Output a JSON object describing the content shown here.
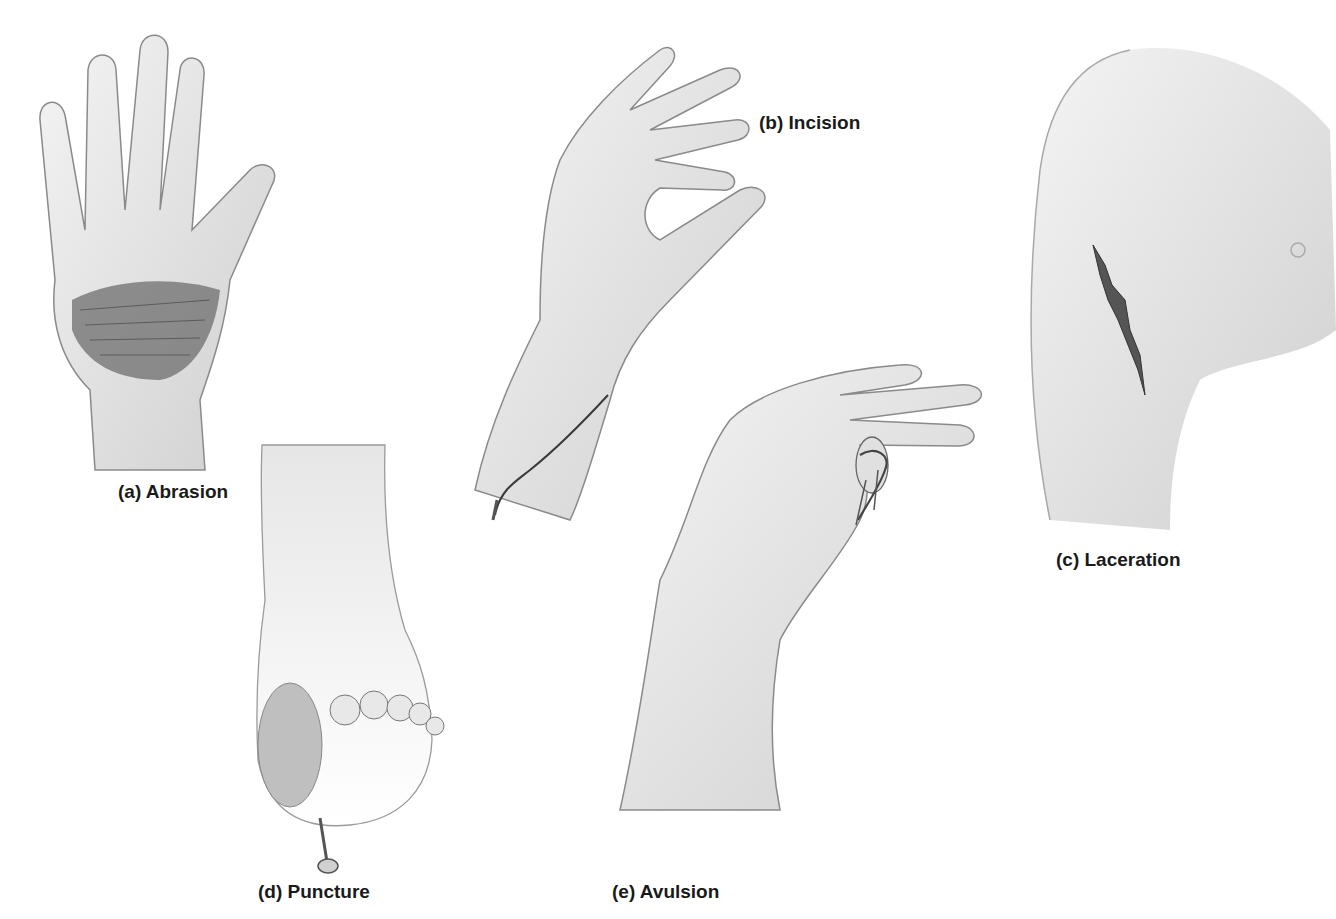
{
  "figure": {
    "panels": [
      {
        "id": "a",
        "label": "(a) Abrasion",
        "subject": "palm of hand with scraped skin"
      },
      {
        "id": "b",
        "label": "(b) Incision",
        "subject": "hand and wrist with straight cut"
      },
      {
        "id": "c",
        "label": "(c) Laceration",
        "subject": "upper arm with jagged tear"
      },
      {
        "id": "d",
        "label": "(d) Puncture",
        "subject": "sole of foot pierced by nail"
      },
      {
        "id": "e",
        "label": "(e) Avulsion",
        "subject": "hand with torn flap of skin on thumb"
      }
    ],
    "colors": {
      "skin": "#efefef",
      "shade": "#c8c8c8",
      "outline": "#8a8a8a",
      "wound": "#555555",
      "text": "#1a1a1a"
    }
  }
}
